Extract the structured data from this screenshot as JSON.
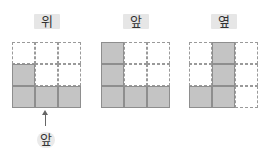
{
  "views": [
    {
      "id": "top",
      "label": "위",
      "cells": [
        [
          0,
          0,
          0
        ],
        [
          1,
          0,
          0
        ],
        [
          1,
          1,
          1
        ]
      ]
    },
    {
      "id": "front",
      "label": "앞",
      "cells": [
        [
          1,
          0,
          0
        ],
        [
          1,
          0,
          0
        ],
        [
          1,
          1,
          1
        ]
      ]
    },
    {
      "id": "side",
      "label": "옆",
      "cells": [
        [
          0,
          1,
          0
        ],
        [
          0,
          1,
          0
        ],
        [
          1,
          1,
          0
        ]
      ]
    }
  ],
  "front_indicator": {
    "label": "앞"
  },
  "colors": {
    "filled": "#c4c4c4",
    "grid_line": "#9a9a9a",
    "label_bg": "#e6e6e6"
  }
}
